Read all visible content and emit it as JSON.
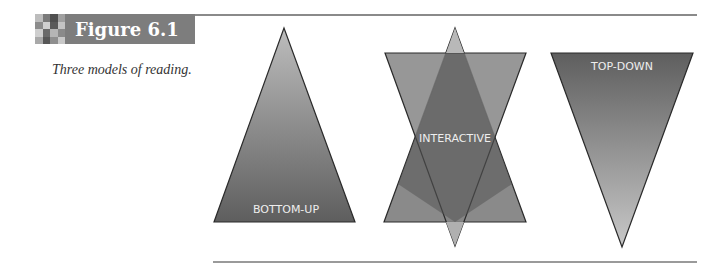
{
  "figure": {
    "label": "Figure 6.1",
    "caption": "Three models of reading."
  },
  "diagram": {
    "models": [
      {
        "name": "bottom-up",
        "label": "BOTTOM-UP",
        "shape": "upward-triangle"
      },
      {
        "name": "interactive",
        "label": "INTERACTIVE",
        "shape": "upward and downward triangles overlapping"
      },
      {
        "name": "top-down",
        "label": "TOP-DOWN",
        "shape": "downward-triangle"
      }
    ]
  },
  "colors": {
    "header_box": "#7d7d7d",
    "triangle_dark": "#5e5e5e",
    "triangle_light": "#bdbdbd",
    "overlap": "#555555",
    "label_text": "#eeeeee"
  }
}
